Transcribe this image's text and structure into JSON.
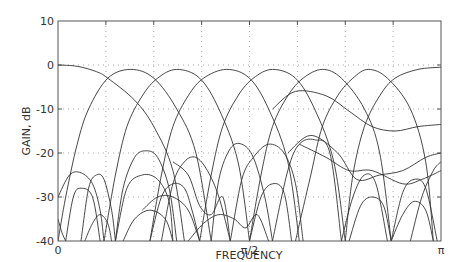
{
  "chart_data": {
    "type": "line",
    "title": "",
    "xlabel": "FREQUENCY",
    "ylabel": "GAIN, dB",
    "xlim": [
      0,
      1
    ],
    "xunit": "pi",
    "ylim": [
      -40,
      10
    ],
    "grid": true,
    "legend": null,
    "x_ticks": [
      {
        "value": 0,
        "label": "0"
      },
      {
        "value": 0.5,
        "label": "π/2"
      },
      {
        "value": 1,
        "label": "π"
      }
    ],
    "x_gridlines": [
      0.125,
      0.25,
      0.375,
      0.5,
      0.625,
      0.75,
      0.875
    ],
    "y_ticks": [
      {
        "value": 10,
        "label": "10"
      },
      {
        "value": 0,
        "label": "0"
      },
      {
        "value": -10,
        "label": "-10"
      },
      {
        "value": -20,
        "label": "-20"
      },
      {
        "value": -30,
        "label": "-30"
      },
      {
        "value": -40,
        "label": "-40"
      }
    ],
    "y_gridlines": [
      0,
      -10,
      -20,
      -30
    ],
    "series": [
      {
        "name": "band-0-main",
        "points": [
          [
            0,
            0
          ],
          [
            0.05,
            -0.3
          ],
          [
            0.1,
            -1.5
          ],
          [
            0.13,
            -3
          ],
          [
            0.2,
            -8
          ],
          [
            0.25,
            -14
          ],
          [
            0.3,
            -24
          ],
          [
            0.33,
            -40
          ]
        ]
      },
      {
        "name": "band-1-main",
        "points": [
          [
            0.0,
            -40
          ],
          [
            0.02,
            -30
          ],
          [
            0.05,
            -18
          ],
          [
            0.08,
            -10
          ],
          [
            0.13,
            -3
          ],
          [
            0.19,
            -1
          ],
          [
            0.25,
            -3
          ],
          [
            0.31,
            -10
          ],
          [
            0.36,
            -20
          ],
          [
            0.4,
            -40
          ]
        ]
      },
      {
        "name": "band-2-main",
        "points": [
          [
            0.12,
            -40
          ],
          [
            0.15,
            -25
          ],
          [
            0.18,
            -14
          ],
          [
            0.22,
            -7
          ],
          [
            0.26,
            -3
          ],
          [
            0.31,
            -1
          ],
          [
            0.37,
            -3
          ],
          [
            0.42,
            -10
          ],
          [
            0.47,
            -22
          ],
          [
            0.5,
            -40
          ]
        ]
      },
      {
        "name": "band-3-main",
        "points": [
          [
            0.24,
            -40
          ],
          [
            0.27,
            -25
          ],
          [
            0.3,
            -14
          ],
          [
            0.34,
            -7
          ],
          [
            0.38,
            -3
          ],
          [
            0.44,
            -1
          ],
          [
            0.5,
            -3
          ],
          [
            0.55,
            -10
          ],
          [
            0.6,
            -22
          ],
          [
            0.63,
            -40
          ]
        ]
      },
      {
        "name": "band-4-main",
        "points": [
          [
            0.37,
            -40
          ],
          [
            0.4,
            -25
          ],
          [
            0.43,
            -14
          ],
          [
            0.47,
            -7
          ],
          [
            0.51,
            -3
          ],
          [
            0.56,
            -1
          ],
          [
            0.62,
            -3
          ],
          [
            0.67,
            -10
          ],
          [
            0.72,
            -22
          ],
          [
            0.75,
            -40
          ]
        ]
      },
      {
        "name": "band-5-main",
        "points": [
          [
            0.5,
            -40
          ],
          [
            0.53,
            -25
          ],
          [
            0.56,
            -14
          ],
          [
            0.6,
            -7
          ],
          [
            0.64,
            -3
          ],
          [
            0.69,
            -1
          ],
          [
            0.74,
            -3
          ],
          [
            0.8,
            -10
          ],
          [
            0.84,
            -20
          ],
          [
            0.87,
            -40
          ]
        ]
      },
      {
        "name": "band-6-main",
        "points": [
          [
            0.62,
            -40
          ],
          [
            0.66,
            -25
          ],
          [
            0.69,
            -14
          ],
          [
            0.73,
            -7
          ],
          [
            0.77,
            -3
          ],
          [
            0.81,
            -1
          ],
          [
            0.86,
            -3
          ],
          [
            0.92,
            -10
          ],
          [
            0.96,
            -22
          ],
          [
            0.98,
            -40
          ]
        ]
      },
      {
        "name": "band-7-main",
        "points": [
          [
            0.75,
            -40
          ],
          [
            0.77,
            -25
          ],
          [
            0.8,
            -14
          ],
          [
            0.84,
            -7
          ],
          [
            0.88,
            -3
          ],
          [
            0.94,
            -1
          ],
          [
            1.0,
            -0.5
          ]
        ]
      },
      {
        "name": "band-6-wave",
        "points": [
          [
            0.56,
            -10
          ],
          [
            0.62,
            -6
          ],
          [
            0.7,
            -7
          ],
          [
            0.76,
            -10.5
          ],
          [
            0.82,
            -14
          ],
          [
            0.88,
            -15
          ],
          [
            0.94,
            -14
          ],
          [
            1.0,
            -13.5
          ]
        ]
      },
      {
        "name": "lobe-a",
        "points": [
          [
            0.15,
            -40
          ],
          [
            0.17,
            -28
          ],
          [
            0.2,
            -21
          ],
          [
            0.23,
            -19.5
          ],
          [
            0.26,
            -21
          ],
          [
            0.29,
            -28
          ],
          [
            0.31,
            -40
          ]
        ]
      },
      {
        "name": "lobe-b",
        "points": [
          [
            0.15,
            -40
          ],
          [
            0.18,
            -28
          ],
          [
            0.22,
            -25
          ],
          [
            0.26,
            -26
          ],
          [
            0.29,
            -31
          ],
          [
            0.3,
            -40
          ]
        ]
      },
      {
        "name": "lobe-c",
        "points": [
          [
            0.4,
            -40
          ],
          [
            0.42,
            -26
          ],
          [
            0.45,
            -19
          ],
          [
            0.48,
            -18
          ],
          [
            0.51,
            -21
          ],
          [
            0.54,
            -30
          ],
          [
            0.56,
            -40
          ]
        ]
      },
      {
        "name": "lobe-d",
        "points": [
          [
            0.45,
            -40
          ],
          [
            0.48,
            -26
          ],
          [
            0.51,
            -21
          ],
          [
            0.55,
            -18
          ],
          [
            0.59,
            -20
          ],
          [
            0.62,
            -27
          ],
          [
            0.64,
            -40
          ]
        ]
      },
      {
        "name": "lobe-e",
        "points": [
          [
            0.56,
            -40
          ],
          [
            0.6,
            -24
          ],
          [
            0.63,
            -18
          ],
          [
            0.67,
            -17
          ],
          [
            0.71,
            -20
          ],
          [
            0.74,
            -40
          ]
        ]
      },
      {
        "name": "lobe-f",
        "points": [
          [
            0.6,
            -20
          ],
          [
            0.66,
            -16
          ],
          [
            0.73,
            -20
          ],
          [
            0.78,
            -26
          ],
          [
            0.84,
            -25
          ],
          [
            0.9,
            -24
          ],
          [
            0.96,
            -21
          ],
          [
            1.0,
            -20
          ]
        ]
      },
      {
        "name": "lobe-g",
        "points": [
          [
            0.63,
            -18
          ],
          [
            0.7,
            -21
          ],
          [
            0.76,
            -24
          ],
          [
            0.82,
            -24
          ],
          [
            0.9,
            -27
          ],
          [
            0.95,
            -26
          ],
          [
            1.0,
            -24
          ]
        ]
      },
      {
        "name": "lobe-h",
        "points": [
          [
            0.74,
            -40
          ],
          [
            0.77,
            -30
          ],
          [
            0.8,
            -25
          ],
          [
            0.83,
            -27
          ],
          [
            0.86,
            -40
          ]
        ]
      },
      {
        "name": "lobe-i",
        "points": [
          [
            0.76,
            -40
          ],
          [
            0.79,
            -32
          ],
          [
            0.82,
            -30
          ],
          [
            0.85,
            -32
          ],
          [
            0.87,
            -40
          ]
        ]
      },
      {
        "name": "lobe-j",
        "points": [
          [
            0.87,
            -40
          ],
          [
            0.9,
            -29
          ],
          [
            0.93,
            -26
          ],
          [
            0.96,
            -28
          ],
          [
            0.99,
            -40
          ]
        ]
      },
      {
        "name": "lobe-k",
        "points": [
          [
            0.87,
            -40
          ],
          [
            0.9,
            -34
          ],
          [
            0.93,
            -31
          ],
          [
            0.96,
            -33
          ],
          [
            0.98,
            -40
          ]
        ]
      },
      {
        "name": "lobe-l",
        "points": [
          [
            0.0,
            -30
          ],
          [
            0.03,
            -25
          ],
          [
            0.06,
            -24.5
          ],
          [
            0.09,
            -27
          ],
          [
            0.11,
            -33
          ],
          [
            0.12,
            -40
          ]
        ]
      },
      {
        "name": "lobe-m",
        "points": [
          [
            0.02,
            -40
          ],
          [
            0.04,
            -30
          ],
          [
            0.06,
            -28
          ],
          [
            0.09,
            -30
          ],
          [
            0.11,
            -40
          ]
        ]
      },
      {
        "name": "lobe-n",
        "points": [
          [
            0.06,
            -40
          ],
          [
            0.08,
            -28
          ],
          [
            0.1,
            -25
          ],
          [
            0.12,
            -26
          ],
          [
            0.14,
            -33
          ],
          [
            0.15,
            -40
          ]
        ]
      },
      {
        "name": "lobe-o",
        "points": [
          [
            0.24,
            -40
          ],
          [
            0.27,
            -30
          ],
          [
            0.3,
            -27
          ],
          [
            0.33,
            -28
          ],
          [
            0.35,
            -33
          ],
          [
            0.37,
            -40
          ]
        ]
      },
      {
        "name": "lobe-p",
        "points": [
          [
            0.22,
            -33
          ],
          [
            0.26,
            -30
          ],
          [
            0.3,
            -30
          ],
          [
            0.34,
            -33
          ],
          [
            0.37,
            -40
          ]
        ]
      },
      {
        "name": "lobe-q",
        "points": [
          [
            0.17,
            -40
          ],
          [
            0.2,
            -35
          ],
          [
            0.24,
            -33
          ],
          [
            0.28,
            -35
          ],
          [
            0.3,
            -40
          ]
        ]
      },
      {
        "name": "lobe-r",
        "points": [
          [
            0.34,
            -40
          ],
          [
            0.38,
            -36
          ],
          [
            0.42,
            -34
          ],
          [
            0.46,
            -35
          ],
          [
            0.49,
            -37
          ],
          [
            0.52,
            -34
          ],
          [
            0.55,
            -40
          ]
        ]
      },
      {
        "name": "lobe-s",
        "points": [
          [
            0.27,
            -40
          ],
          [
            0.3,
            -27
          ],
          [
            0.33,
            -22
          ],
          [
            0.36,
            -21
          ],
          [
            0.39,
            -24
          ],
          [
            0.42,
            -30
          ],
          [
            0.45,
            -40
          ]
        ]
      },
      {
        "name": "lobe-t",
        "points": [
          [
            0.3,
            -22
          ],
          [
            0.34,
            -25
          ],
          [
            0.37,
            -32
          ],
          [
            0.4,
            -34
          ],
          [
            0.43,
            -30
          ],
          [
            0.45,
            -40
          ]
        ]
      },
      {
        "name": "lobe-u",
        "points": [
          [
            0.5,
            -40
          ],
          [
            0.53,
            -30
          ],
          [
            0.56,
            -27
          ],
          [
            0.59,
            -29
          ],
          [
            0.61,
            -40
          ]
        ]
      },
      {
        "name": "lobe-v",
        "points": [
          [
            0.07,
            -40
          ],
          [
            0.09,
            -36
          ],
          [
            0.11,
            -34
          ],
          [
            0.13,
            -36
          ],
          [
            0.14,
            -40
          ]
        ]
      },
      {
        "name": "lobe-w",
        "points": [
          [
            0.0,
            -35
          ],
          [
            0.01,
            -38
          ],
          [
            0.02,
            -40
          ]
        ]
      },
      {
        "name": "lobe-x",
        "points": [
          [
            0.92,
            -40
          ],
          [
            0.95,
            -30
          ],
          [
            0.98,
            -24
          ],
          [
            1.0,
            -22
          ]
        ]
      }
    ]
  }
}
